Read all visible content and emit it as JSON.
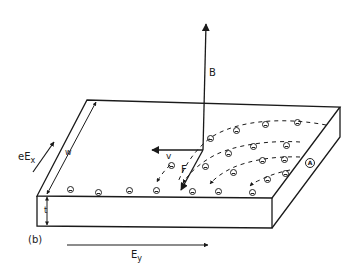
{
  "figure": {
    "panel_label": "(b)"
  },
  "labels": {
    "magnetic_field": "B",
    "velocity": "v",
    "force": "F",
    "electric_force_x": "eE",
    "electric_force_x_sub": "x",
    "width": "w",
    "thickness": "t",
    "electric_field_y": "E",
    "electric_field_y_sub": "y",
    "hole_marker": "A"
  },
  "colors": {
    "ink": "#1a1a1a",
    "background": "#ffffff"
  },
  "charges": {
    "electron_symbol": "⊖",
    "front_edge_electrons": 10,
    "trajectory_electrons": 16,
    "holes": 1
  }
}
